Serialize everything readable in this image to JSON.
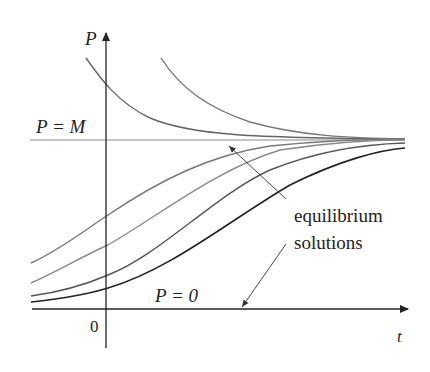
{
  "figure": {
    "type": "logistic-solution-curves",
    "axes": {
      "vertical_label": "P",
      "horizontal_label": "t",
      "origin_label": "0"
    },
    "labels": {
      "carrying_capacity": "P = M",
      "zero_solution": "P = 0",
      "annotation_line1": "equilibrium",
      "annotation_line2": "solutions"
    },
    "colors": {
      "axis": "#222222",
      "equilibrium_line": "#888888",
      "curves_above": "#666666",
      "curves_below_light": "#777777",
      "curves_below_dark": "#222222"
    },
    "curves": [
      {
        "name": "above-M-1",
        "start": "upper-left near P-axis",
        "behavior": "decreases to M"
      },
      {
        "name": "above-M-2",
        "start": "upper-middle",
        "behavior": "decreases to M"
      },
      {
        "name": "below-M-1",
        "behavior": "increases to M"
      },
      {
        "name": "below-M-2",
        "behavior": "increases to M"
      },
      {
        "name": "below-M-3",
        "behavior": "increases to M"
      },
      {
        "name": "below-M-4",
        "behavior": "increases to M (darkest)"
      }
    ]
  }
}
